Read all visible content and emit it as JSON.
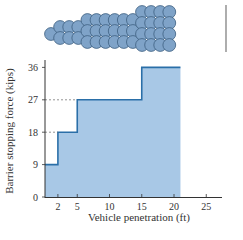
{
  "chart_data": {
    "type": "area",
    "subtype": "step",
    "title": "",
    "xlabel": "Vehicle penetration (ft)",
    "ylabel": "Barrier stopping force (kips)",
    "x_ticks": [
      2,
      5,
      10,
      15,
      20,
      25
    ],
    "y_ticks": [
      0,
      9,
      18,
      27,
      36
    ],
    "xlim": [
      0,
      27
    ],
    "ylim": [
      0,
      38
    ],
    "grid": false,
    "legend": null,
    "series": [
      {
        "name": "Barrier stopping force",
        "steps": [
          {
            "x_start": 0,
            "x_end": 2,
            "y": 9
          },
          {
            "x_start": 2,
            "x_end": 5,
            "y": 18
          },
          {
            "x_start": 5,
            "x_end": 15,
            "y": 27
          },
          {
            "x_start": 15,
            "x_end": 21,
            "y": 36
          }
        ]
      }
    ],
    "reference_lines": [
      {
        "y": 18,
        "style": "dashed",
        "from_x": 0,
        "to_x": 2
      },
      {
        "y": 27,
        "style": "dashed",
        "from_x": 0,
        "to_x": 5
      }
    ],
    "illustration": {
      "description": "Crash barrier of circular barrels, rows increasing from 2 to 4",
      "columns": [
        {
          "count": 1
        },
        {
          "count": 2
        },
        {
          "count": 2
        },
        {
          "count": 2
        },
        {
          "count": 3
        },
        {
          "count": 3
        },
        {
          "count": 3
        },
        {
          "count": 3
        },
        {
          "count": 3
        },
        {
          "count": 3
        },
        {
          "count": 4
        },
        {
          "count": 4
        },
        {
          "count": 4
        },
        {
          "count": 4
        }
      ]
    }
  },
  "colors": {
    "fill": "#a8c8e6",
    "line": "#2a6fa8",
    "barrel": "#7fa3c8",
    "barrel_stroke": "#3d5f80",
    "axis": "#333333"
  },
  "labels": {
    "ylabel": "Barrier stopping force (kips)",
    "xlabel": "Vehicle penetration (ft)",
    "yticks": [
      "0",
      "9",
      "18",
      "27",
      "36"
    ],
    "xticks": [
      "2",
      "5",
      "10",
      "15",
      "20",
      "25"
    ]
  }
}
